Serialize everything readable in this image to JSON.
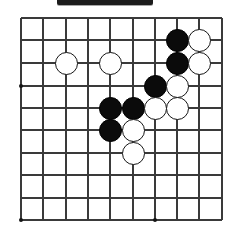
{
  "figure": {
    "kind": "go-board-diagram",
    "caption_bar": {
      "visible": true,
      "text": "",
      "color": "#1c1c1c"
    }
  },
  "board": {
    "label": "Go board grid",
    "columns": 10,
    "rows": 10,
    "line_color": "#3a3a3a",
    "background_color": "#ffffff",
    "cell_size": 22.3,
    "origin_x": 21,
    "origin_y": 18,
    "column_x": [
      21,
      43,
      66,
      88,
      110,
      133,
      155,
      177,
      199,
      222
    ],
    "row_y": [
      18,
      40,
      63,
      86,
      108,
      130,
      153,
      175,
      198,
      220
    ],
    "star_points": [
      {
        "col": 0,
        "row": 3
      },
      {
        "col": 0,
        "row": 9
      },
      {
        "col": 6,
        "row": 9
      }
    ]
  },
  "stones": {
    "black_color": "#0b0b0b",
    "white_color": "#ffffff",
    "black_count": 6,
    "white_count": 9,
    "list": [
      {
        "color": "black",
        "col": 7,
        "row": 1
      },
      {
        "color": "white",
        "col": 8,
        "row": 1
      },
      {
        "color": "white",
        "col": 2,
        "row": 2
      },
      {
        "color": "white",
        "col": 4,
        "row": 2
      },
      {
        "color": "black",
        "col": 7,
        "row": 2
      },
      {
        "color": "white",
        "col": 8,
        "row": 2
      },
      {
        "color": "black",
        "col": 6,
        "row": 3
      },
      {
        "color": "white",
        "col": 7,
        "row": 3
      },
      {
        "color": "black",
        "col": 4,
        "row": 4
      },
      {
        "color": "black",
        "col": 5,
        "row": 4
      },
      {
        "color": "white",
        "col": 6,
        "row": 4
      },
      {
        "color": "white",
        "col": 7,
        "row": 4
      },
      {
        "color": "black",
        "col": 4,
        "row": 5
      },
      {
        "color": "white",
        "col": 5,
        "row": 5
      },
      {
        "color": "white",
        "col": 5,
        "row": 6
      }
    ]
  }
}
